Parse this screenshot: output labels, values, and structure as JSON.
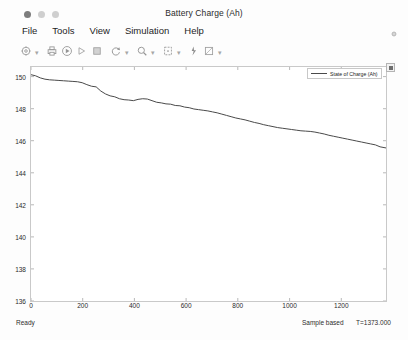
{
  "window": {
    "title": "Battery Charge (Ah)",
    "controls": [
      {
        "name": "close",
        "label": ""
      },
      {
        "name": "minimize",
        "label": ""
      },
      {
        "name": "maximize",
        "label": ""
      }
    ]
  },
  "menubar": {
    "items": [
      {
        "label": "File"
      },
      {
        "label": "Tools"
      },
      {
        "label": "View"
      },
      {
        "label": "Simulation"
      },
      {
        "label": "Help"
      }
    ]
  },
  "toolbar": {
    "groups": [
      {
        "buttons": [
          {
            "icon": "configuration-properties-icon",
            "caret": true
          }
        ]
      },
      {
        "buttons": [
          {
            "icon": "print-icon",
            "caret": false
          },
          {
            "icon": "run-icon",
            "caret": false
          },
          {
            "icon": "step-forward-icon",
            "caret": false
          },
          {
            "icon": "stop-icon",
            "caret": false
          }
        ]
      },
      {
        "buttons": [
          {
            "icon": "rotate-restore-icon",
            "caret": true
          }
        ]
      },
      {
        "buttons": [
          {
            "icon": "zoom-icon",
            "caret": true
          }
        ]
      },
      {
        "buttons": [
          {
            "icon": "autoscale-icon",
            "caret": true
          }
        ]
      },
      {
        "buttons": [
          {
            "icon": "cursor-measurements-icon",
            "caret": false
          },
          {
            "icon": "signal-statistics-icon",
            "caret": true
          }
        ]
      }
    ]
  },
  "legend": {
    "entries": [
      {
        "label": "State of Charge (Ah)",
        "color": "#4a4a4a"
      }
    ]
  },
  "statusbar": {
    "ready": "Ready",
    "mode": "Sample based",
    "time": "T=1373.000"
  },
  "chart_data": {
    "type": "line",
    "title": "Battery Charge (Ah)",
    "xlabel": "",
    "ylabel": "",
    "xlim": [
      0,
      1373
    ],
    "ylim": [
      136,
      150.6
    ],
    "grid": false,
    "legend_position": "top-right",
    "xticks": [
      0,
      200,
      400,
      600,
      800,
      1000,
      1200
    ],
    "xtick_labels": [
      "0",
      "200",
      "400",
      "600",
      "800",
      "1000",
      "1200"
    ],
    "yticks": [
      136,
      138,
      140,
      142,
      144,
      146,
      148,
      150
    ],
    "ytick_labels": [
      "136",
      "138",
      "140",
      "142",
      "144",
      "146",
      "148",
      "150"
    ],
    "series": [
      {
        "name": "State of Charge (Ah)",
        "color": "#4a4a4a",
        "x": [
          0,
          18,
          36,
          54,
          72,
          90,
          108,
          126,
          144,
          162,
          180,
          198,
          216,
          234,
          252,
          270,
          288,
          306,
          324,
          342,
          360,
          378,
          396,
          414,
          432,
          450,
          468,
          486,
          504,
          522,
          540,
          558,
          576,
          594,
          612,
          630,
          648,
          666,
          684,
          702,
          720,
          738,
          756,
          774,
          792,
          810,
          828,
          846,
          864,
          882,
          900,
          918,
          936,
          954,
          972,
          990,
          1008,
          1026,
          1044,
          1062,
          1080,
          1098,
          1116,
          1134,
          1152,
          1170,
          1188,
          1206,
          1224,
          1242,
          1260,
          1278,
          1296,
          1314,
          1332,
          1350,
          1373
        ],
        "y": [
          150.12,
          150.05,
          149.92,
          149.84,
          149.8,
          149.78,
          149.76,
          149.74,
          149.72,
          149.7,
          149.68,
          149.62,
          149.5,
          149.4,
          149.36,
          149.1,
          148.92,
          148.8,
          148.74,
          148.62,
          148.56,
          148.54,
          148.5,
          148.58,
          148.62,
          148.6,
          148.5,
          148.4,
          148.36,
          148.3,
          148.28,
          148.2,
          148.18,
          148.1,
          148.06,
          147.98,
          147.94,
          147.9,
          147.86,
          147.8,
          147.74,
          147.66,
          147.58,
          147.5,
          147.42,
          147.36,
          147.3,
          147.22,
          147.14,
          147.08,
          147.0,
          146.94,
          146.88,
          146.82,
          146.78,
          146.74,
          146.7,
          146.66,
          146.62,
          146.6,
          146.58,
          146.54,
          146.48,
          146.42,
          146.34,
          146.28,
          146.22,
          146.16,
          146.1,
          146.04,
          145.98,
          145.92,
          145.86,
          145.8,
          145.74,
          145.62,
          145.55
        ]
      }
    ]
  }
}
